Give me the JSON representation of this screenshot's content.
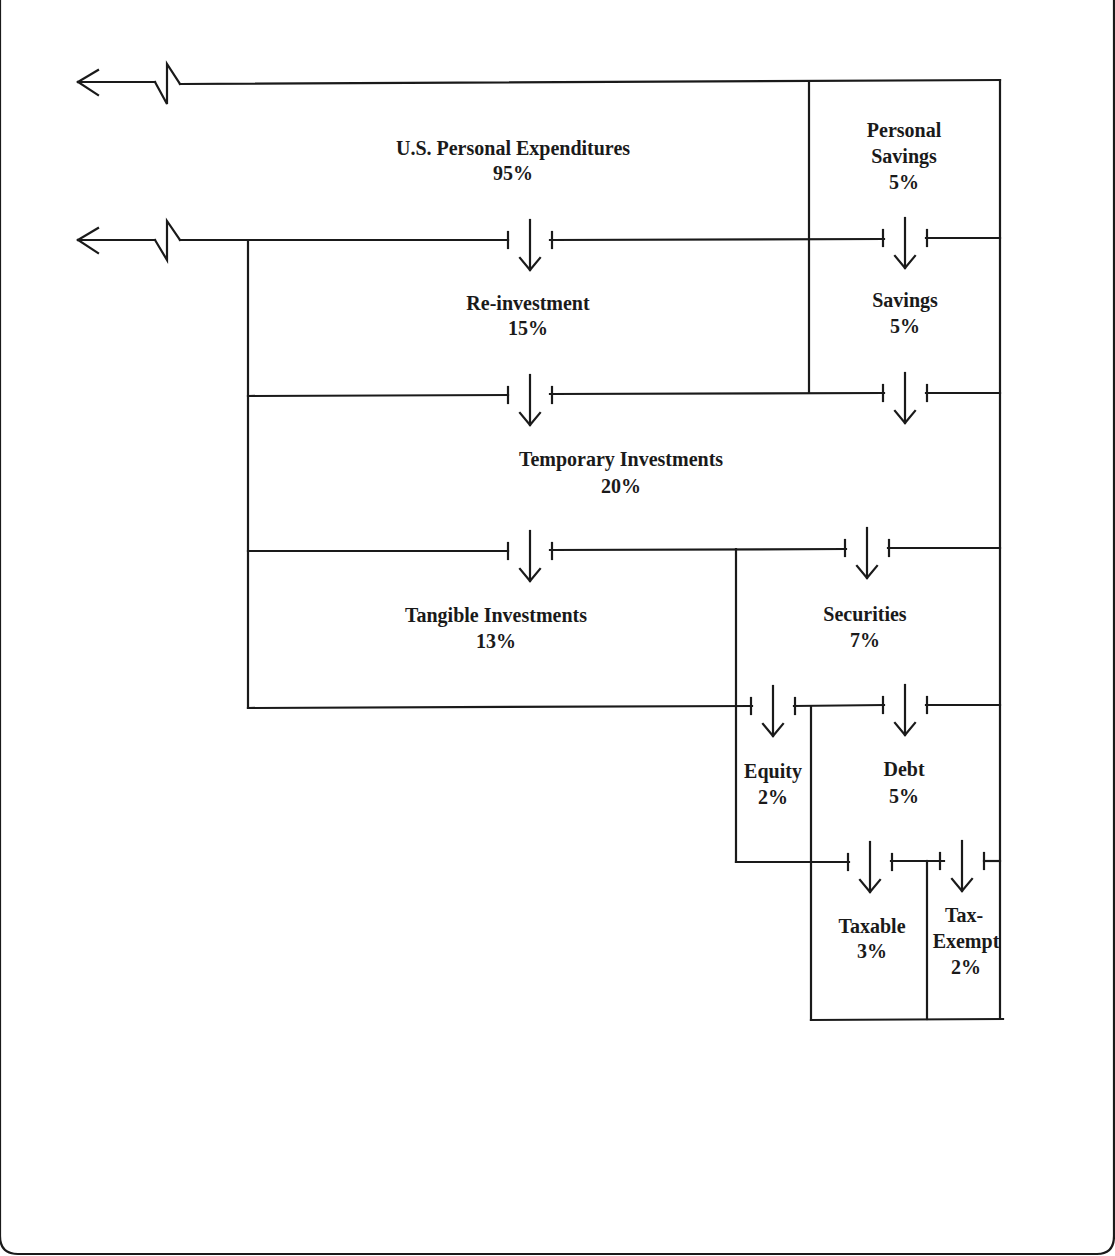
{
  "diagram": {
    "type": "flow-partition",
    "nodes": [
      {
        "id": "expenditures",
        "label": "U.S. Personal Expenditures",
        "value": "95%"
      },
      {
        "id": "personal_savings",
        "label_line1": "Personal",
        "label_line2": "Savings",
        "value": "5%"
      },
      {
        "id": "reinvestment",
        "label": "Re-investment",
        "value": "15%"
      },
      {
        "id": "savings",
        "label": "Savings",
        "value": "5%"
      },
      {
        "id": "temporary",
        "label": "Temporary Investments",
        "value": "20%"
      },
      {
        "id": "tangible",
        "label": "Tangible Investments",
        "value": "13%"
      },
      {
        "id": "securities",
        "label": "Securities",
        "value": "7%"
      },
      {
        "id": "equity",
        "label": "Equity",
        "value": "2%"
      },
      {
        "id": "debt",
        "label": "Debt",
        "value": "5%"
      },
      {
        "id": "taxable",
        "label": "Taxable",
        "value": "3%"
      },
      {
        "id": "tax_exempt",
        "label_line1": "Tax-",
        "label_line2": "Exempt",
        "value": "2%"
      }
    ],
    "flows": [
      {
        "from": "expenditures",
        "to": "reinvestment"
      },
      {
        "from": "personal_savings",
        "to": "savings"
      },
      {
        "from": "reinvestment",
        "to": "temporary"
      },
      {
        "from": "savings",
        "to": "temporary"
      },
      {
        "from": "temporary",
        "to": "tangible"
      },
      {
        "from": "temporary",
        "to": "securities"
      },
      {
        "from": "securities",
        "to": "equity"
      },
      {
        "from": "securities",
        "to": "debt"
      },
      {
        "from": "debt",
        "to": "taxable"
      },
      {
        "from": "debt",
        "to": "tax_exempt"
      }
    ],
    "arrows_out_left": 2
  }
}
